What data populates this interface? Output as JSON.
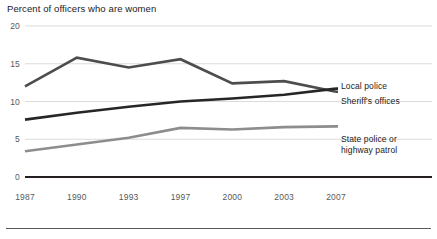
{
  "chart_data": {
    "type": "line",
    "title": "Percent of officers who are women",
    "xlabel": "",
    "ylabel": "",
    "x": [
      1987,
      1990,
      1993,
      1997,
      2000,
      2003,
      2007
    ],
    "categories": [
      "1987",
      "1990",
      "1993",
      "1997",
      "2000",
      "2003",
      "2007"
    ],
    "ylim": [
      0,
      20
    ],
    "yticks": [
      0,
      5,
      10,
      15,
      20
    ],
    "ytick_labels": [
      "0",
      "5",
      "10",
      "15",
      "20"
    ],
    "grid": true,
    "legend_position": "right-inline",
    "series": [
      {
        "name": "Local police",
        "color": "#4d4d4d",
        "values": [
          12.0,
          15.8,
          14.5,
          15.6,
          12.4,
          12.7,
          11.3
        ]
      },
      {
        "name": "Sheriff's offices",
        "color": "#262626",
        "values": [
          7.6,
          8.5,
          9.3,
          10.0,
          10.4,
          10.9,
          11.7
        ]
      },
      {
        "name": "State police or highway patrol",
        "color": "#8d8d8d",
        "values": [
          3.4,
          4.3,
          5.2,
          6.5,
          6.3,
          6.6,
          6.7
        ]
      }
    ],
    "annotations": []
  },
  "labels": {
    "local_police": "Local police",
    "sheriffs_offices": "Sheriff's offices",
    "state_police_line1": "State police or",
    "state_police_line2": "highway patrol"
  }
}
